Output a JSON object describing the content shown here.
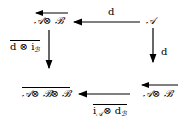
{
  "diagram": {
    "type": "commutative-square",
    "nodes": {
      "top_left": {
        "text": "𝒜⊗ ℬ",
        "overarrow": "left"
      },
      "top_right": {
        "text": "𝒜"
      },
      "bottom_left": {
        "text": "𝒜⊗ ℬ⊗ ℬ",
        "overline": true
      },
      "bottom_right": {
        "text": "𝒜⊗ ℬ",
        "overarrow": "left"
      }
    },
    "edges": {
      "top": {
        "from": "top_right",
        "to": "top_left",
        "label": "d"
      },
      "right": {
        "from": "top_right",
        "to": "bottom_right",
        "label": "d"
      },
      "left": {
        "from": "top_left",
        "to": "bottom_left",
        "label_main": "d ⊗ i",
        "label_sub": "ℬ",
        "overline": true
      },
      "bottom": {
        "from": "bottom_right",
        "to": "bottom_left",
        "label_a": "i",
        "label_a_sub": "𝒜",
        "label_b": "⊗ d",
        "label_b_sub": "ℬ",
        "overline": true
      }
    }
  }
}
